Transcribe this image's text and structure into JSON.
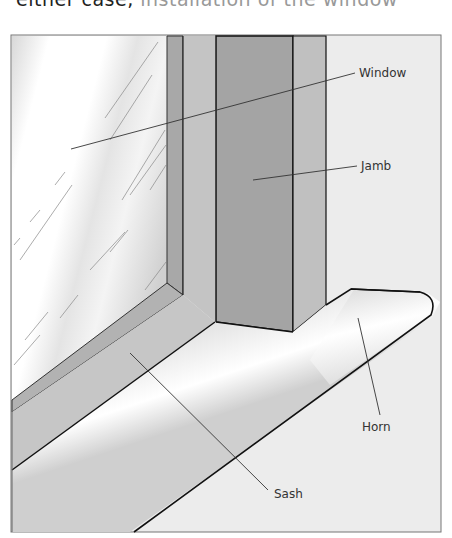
{
  "caption_fragment": {
    "dark": "either case,",
    "faded": " installation of the window"
  },
  "figure": {
    "labels": {
      "window": "Window",
      "jamb": "Jamb",
      "horn": "Horn",
      "sash": "Sash"
    }
  }
}
